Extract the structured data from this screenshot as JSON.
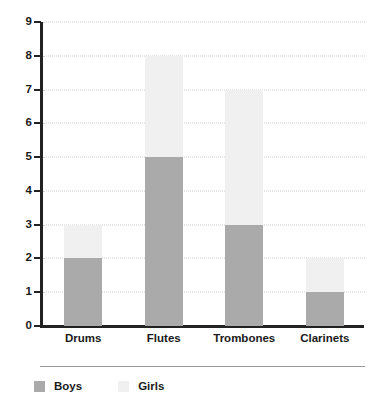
{
  "chart_data": {
    "type": "bar",
    "subtype": "stacked-bar",
    "title": "",
    "subtitle": "",
    "xlabel": "",
    "ylabel": "",
    "categories": [
      "Drums",
      "Flutes",
      "Trombones",
      "Clarinets"
    ],
    "series": [
      {
        "name": "Boys",
        "values": [
          2,
          5,
          3,
          1
        ],
        "color": "#aaaaaa"
      },
      {
        "name": "Girls",
        "values": [
          1,
          3,
          4,
          1
        ],
        "color": "#f0f0f0"
      }
    ],
    "stacked_totals": [
      3,
      8,
      7,
      2
    ],
    "ylim": [
      0,
      9
    ],
    "ytick_labels": [
      "0",
      "1",
      "2",
      "3",
      "4",
      "5",
      "6",
      "7",
      "8",
      "9"
    ],
    "ytick_values": [
      0,
      1,
      2,
      3,
      4,
      5,
      6,
      7,
      8,
      9
    ],
    "grid": true,
    "grid_style": "dotted",
    "legend_position": "bottom-left",
    "legend": [
      {
        "label": "Boys",
        "color": "#aaaaaa"
      },
      {
        "label": "Girls",
        "color": "#f0f0f0"
      }
    ],
    "axis_color": "#222222",
    "grid_color": "#cfcfcf",
    "background": "#ffffff"
  }
}
